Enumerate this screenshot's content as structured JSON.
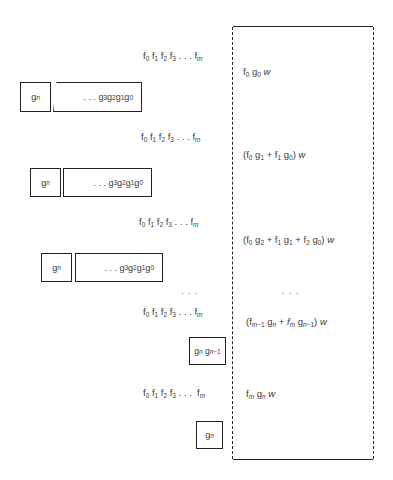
{
  "diagram": {
    "f_sequence_label": "f0 f1 f2 f3 . . . fm",
    "g_register_head": "gn",
    "g_register_tail": ". . . g3 g2 g1 g0",
    "steps": [
      {
        "f_label": "f0 f1 f2 f3 . . . fm",
        "g_head": "gn",
        "g_tail": ". . . g3 g2 g1 g0",
        "accumulator": "f0g0w"
      },
      {
        "f_label": "f0 f1 f2 f3 . . . fm",
        "g_head": "gn",
        "g_tail": ". . . g3 g2 g1 g0",
        "accumulator": "(f0g1 + f1g0)w"
      },
      {
        "f_label": "f0 f1 f2 f3 . . . fm",
        "g_head": "gn",
        "g_tail": ". . . g3 g2 g1 g0",
        "accumulator": "(f0g2 + f1g1 + f2g0)w"
      },
      {
        "f_label": "f0 f1 f2 f3 . . . fm",
        "g_head": "gn gn-1",
        "accumulator": "(fm-1gn + fmgn-1)w"
      },
      {
        "f_label": "f0 f1 f2 f3 . . . fm",
        "g_head": "gn",
        "accumulator": "fmgnw"
      }
    ],
    "ellipsis_left": ". . .",
    "ellipsis_right": ". . .",
    "accumulator_border": "dashed"
  }
}
